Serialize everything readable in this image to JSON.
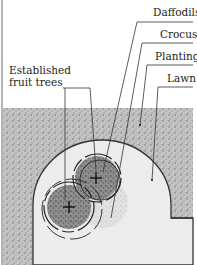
{
  "labels": {
    "daffodils": "Daffodils",
    "crocus": "Crocus",
    "planting": "Planting",
    "lawn": "Lawn",
    "fruit_trees_line1": "Established",
    "fruit_trees_line2": "fruit trees"
  },
  "colors": {
    "planting_fill": "#b9b9b9",
    "lawn_fill": "#ececec",
    "tree_canopy": "#8a8a8a",
    "line": "#333333"
  }
}
